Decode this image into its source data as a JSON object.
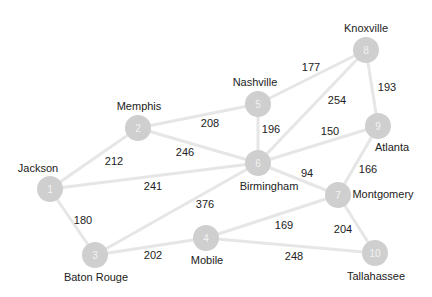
{
  "graph": {
    "nodes": [
      {
        "id": "1",
        "label": "Jackson",
        "x": 50,
        "y": 189,
        "lx": 38,
        "ly": 172
      },
      {
        "id": "2",
        "label": "Memphis",
        "x": 138,
        "y": 128,
        "lx": 139,
        "ly": 110
      },
      {
        "id": "3",
        "label": "Baton Rouge",
        "x": 95,
        "y": 255,
        "lx": 96,
        "ly": 281
      },
      {
        "id": "4",
        "label": "Mobile",
        "x": 206,
        "y": 238,
        "lx": 207,
        "ly": 264
      },
      {
        "id": "5",
        "label": "Nashville",
        "x": 258,
        "y": 104,
        "lx": 255,
        "ly": 86
      },
      {
        "id": "6",
        "label": "Birmingham",
        "x": 258,
        "y": 163,
        "lx": 269,
        "ly": 190
      },
      {
        "id": "7",
        "label": "Montgomery",
        "x": 338,
        "y": 195,
        "lx": 383,
        "ly": 198
      },
      {
        "id": "8",
        "label": "Knoxville",
        "x": 366,
        "y": 50,
        "lx": 366,
        "ly": 32
      },
      {
        "id": "9",
        "label": "Atlanta",
        "x": 378,
        "y": 126,
        "lx": 392,
        "ly": 151
      },
      {
        "id": "10",
        "label": "Tallahassee",
        "x": 375,
        "y": 253,
        "lx": 376,
        "ly": 280
      }
    ],
    "edges": [
      {
        "from": "1",
        "to": "2",
        "weight": "212",
        "wx": 114,
        "wy": 161
      },
      {
        "from": "1",
        "to": "3",
        "weight": "180",
        "wx": 83,
        "wy": 220
      },
      {
        "from": "1",
        "to": "6",
        "weight": "241",
        "wx": 153,
        "wy": 186
      },
      {
        "from": "2",
        "to": "5",
        "weight": "208",
        "wx": 210,
        "wy": 123
      },
      {
        "from": "2",
        "to": "6",
        "weight": "246",
        "wx": 185,
        "wy": 152
      },
      {
        "from": "3",
        "to": "6",
        "weight": "376",
        "wx": 205,
        "wy": 204
      },
      {
        "from": "3",
        "to": "4",
        "weight": "202",
        "wx": 153,
        "wy": 255
      },
      {
        "from": "4",
        "to": "7",
        "weight": "169",
        "wx": 284,
        "wy": 225
      },
      {
        "from": "4",
        "to": "10",
        "weight": "248",
        "wx": 294,
        "wy": 256
      },
      {
        "from": "5",
        "to": "8",
        "weight": "177",
        "wx": 311,
        "wy": 67
      },
      {
        "from": "5",
        "to": "6",
        "weight": "196",
        "wx": 271,
        "wy": 129
      },
      {
        "from": "6",
        "to": "8",
        "weight": "254",
        "wx": 337,
        "wy": 100
      },
      {
        "from": "6",
        "to": "9",
        "weight": "150",
        "wx": 330,
        "wy": 131
      },
      {
        "from": "6",
        "to": "7",
        "weight": "94",
        "wx": 307,
        "wy": 173
      },
      {
        "from": "7",
        "to": "9",
        "weight": "166",
        "wx": 368,
        "wy": 169
      },
      {
        "from": "7",
        "to": "10",
        "weight": "204",
        "wx": 343,
        "wy": 229
      },
      {
        "from": "8",
        "to": "9",
        "weight": "193",
        "wx": 387,
        "wy": 87
      }
    ]
  },
  "colors": {
    "node": "#cfcfcf",
    "edge": "#e6e6e6",
    "text": "#222222"
  }
}
